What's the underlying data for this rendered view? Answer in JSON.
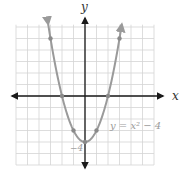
{
  "figure": {
    "x_axis_label": "x",
    "y_axis_label": "y",
    "equation_label": "y = x² − 4",
    "vertex_label": "−4"
  },
  "colors": {
    "grid": "#d4d4d4",
    "axis": "#1a1a1a",
    "curve": "#9a9a9a",
    "label": "#9a9a9a"
  },
  "chart_data": {
    "type": "line",
    "title": "",
    "function": "y = x^2 - 4",
    "xlabel": "x",
    "ylabel": "y",
    "xlim": [
      -6,
      6
    ],
    "ylim": [
      -6,
      6
    ],
    "grid": true,
    "plotted_points": [
      {
        "x": -3,
        "y": 5
      },
      {
        "x": -2,
        "y": 0
      },
      {
        "x": -1,
        "y": -3
      },
      {
        "x": 0,
        "y": -4
      },
      {
        "x": 1,
        "y": -3
      },
      {
        "x": 2,
        "y": 0
      },
      {
        "x": 3,
        "y": 5
      }
    ],
    "annotations": [
      {
        "text": "y = x² − 4",
        "x": 2.3,
        "y": -2.3
      },
      {
        "text": "−4",
        "x": -0.6,
        "y": -4.5
      }
    ]
  }
}
